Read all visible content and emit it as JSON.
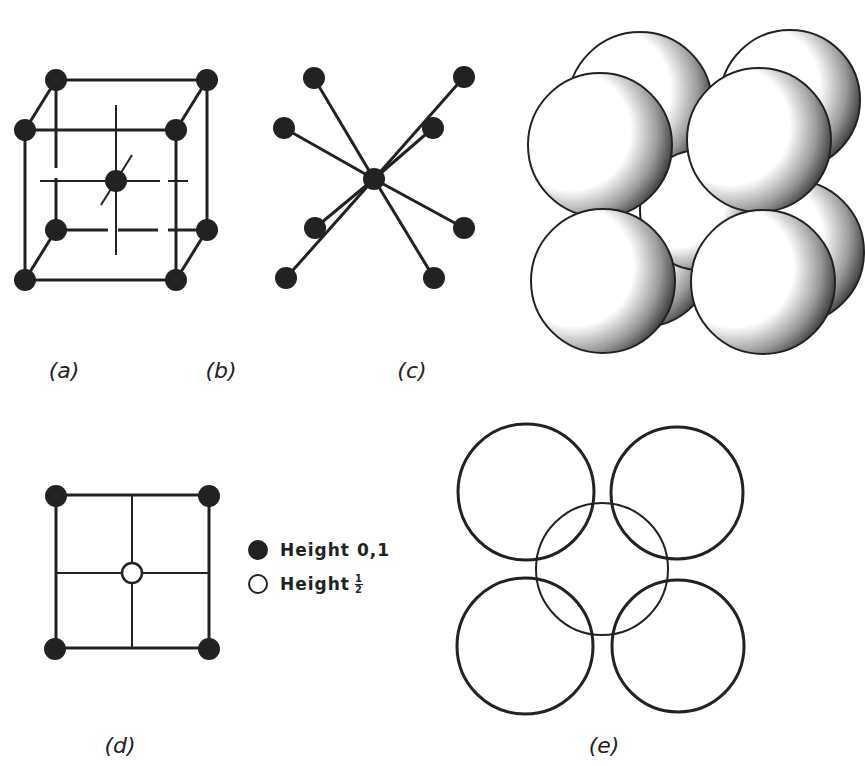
{
  "panels": {
    "a": {
      "label": "(a)",
      "description": "body-centered cubic unit cell, ball-and-stick"
    },
    "b": {
      "label": "(b)",
      "description": "8-fold coordination of central atom"
    },
    "c": {
      "label": "(c)",
      "description": "space-filling sphere model of BCC cell"
    },
    "d": {
      "label": "(d)",
      "description": "plan view projection"
    },
    "e": {
      "label": "(e)",
      "description": "plan view of sphere packing"
    }
  },
  "legend": {
    "items": [
      {
        "symbol": "filled-circle",
        "text": "Height 0,1"
      },
      {
        "symbol": "hollow-circle",
        "text": "Height",
        "fraction": {
          "numerator": "1",
          "denominator": "2"
        }
      }
    ]
  },
  "colors": {
    "ink": "#222222",
    "background": "#ffffff"
  }
}
